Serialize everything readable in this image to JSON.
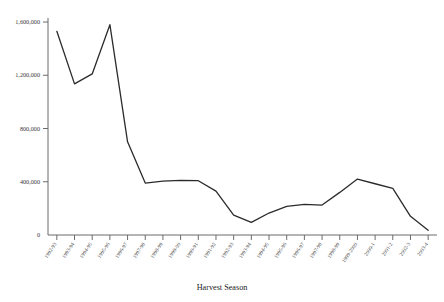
{
  "chart_data": {
    "type": "line",
    "title": "",
    "xlabel": "Harvest Season",
    "ylabel": "",
    "categories": [
      "1992-93",
      "1993-94",
      "1994-95",
      "1995-96",
      "1996-97",
      "1997-98",
      "1998-99",
      "1999-2000",
      "1990-91",
      "1991-92",
      "1992-93",
      "1993-94",
      "1994-95",
      "1995-96",
      "1996-97",
      "1997-98",
      "1998-99",
      "1999-2000",
      "2000-1",
      "2001-2",
      "2002-3",
      "2003-4"
    ],
    "x_tick_labels": [
      "1992-93",
      "1993-94",
      "1994-95",
      "1995-96",
      "1996-97",
      "1997-98",
      "1998-99",
      "1999-00",
      "1990-91",
      "1991-92",
      "1992-93",
      "1993-94",
      "1994-95",
      "1995-96",
      "1996-97",
      "1997-98",
      "1998-99",
      "1999-2000",
      "2000-1",
      "2001-2",
      "2002-3",
      "2003-4"
    ],
    "values": [
      1530000,
      1135000,
      1210000,
      1580000,
      700000,
      390000,
      405000,
      410000,
      408000,
      330000,
      150000,
      95000,
      165000,
      215000,
      230000,
      225000,
      320000,
      420000,
      385000,
      350000,
      140000,
      35000
    ],
    "y_ticks": [
      0,
      400000,
      800000,
      1200000,
      1600000
    ],
    "y_tick_labels": [
      "0",
      "400,000",
      "800,000",
      "1,200,000",
      "1,600,000"
    ],
    "ylim": [
      0,
      1600000
    ],
    "grid": false,
    "legend": "none",
    "line_color": "#2b2b2b",
    "axis_color": "#6b6b6b"
  }
}
